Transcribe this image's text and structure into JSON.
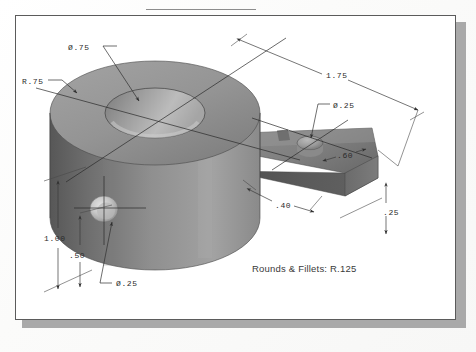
{
  "document": {
    "type": "engineering-drawing",
    "view": "isometric-pictorial",
    "note": "Rounds & Fillets: R.125"
  },
  "dimensions": [
    {
      "id": "bore-diameter",
      "label": "Ø.75",
      "x": 74,
      "y": 50
    },
    {
      "id": "base-radius",
      "label": "R.75",
      "x": 26,
      "y": 82
    },
    {
      "id": "overall-length",
      "label": "1.75",
      "x": 330,
      "y": 72
    },
    {
      "id": "arm-hole-diameter",
      "label": "Ø.25",
      "x": 339,
      "y": 108
    },
    {
      "id": "arm-width",
      "label": ".60",
      "x": 341,
      "y": 157
    },
    {
      "id": "base-height",
      "label": "1.00",
      "x": 50,
      "y": 238
    },
    {
      "id": "boss-height",
      "label": ".50",
      "x": 73,
      "y": 256
    },
    {
      "id": "side-hole-diameter",
      "label": "Ø.25",
      "x": 121,
      "y": 285
    },
    {
      "id": "arm-offset",
      "label": ".40",
      "x": 280,
      "y": 207
    },
    {
      "id": "arm-thickness",
      "label": ".25",
      "x": 388,
      "y": 213
    }
  ],
  "colors": {
    "sheet": "#ffffff",
    "frame_stroke": "#5b5b5b",
    "shadow": "#a9a9a9",
    "line": "#3b3b3b",
    "text": "#2b2b2b",
    "part_light": "#b4b4b4",
    "part_mid": "#8e8e8e",
    "part_dark": "#5d5d5d"
  }
}
